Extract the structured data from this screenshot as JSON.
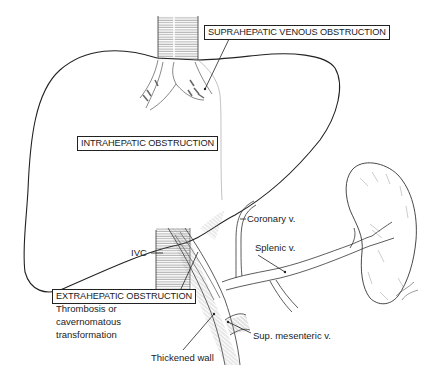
{
  "figure": {
    "labels": {
      "suprahepatic": "SUPRAHEPATIC VENOUS OBSTRUCTION",
      "intrahepatic": "INTRAHEPATIC OBSTRUCTION",
      "extrahepatic": "EXTRAHEPATIC OBSTRUCTION",
      "extrahepatic_detail": [
        "Thrombosis or",
        "cavernomatous",
        "transformation"
      ],
      "ivc": "IVC",
      "coronary": "Coronary v.",
      "splenic": "Splenic v.",
      "sup_mesenteric": "Sup. mesenteric v.",
      "thickened_wall": "Thickened wall"
    },
    "structures": [
      "liver",
      "inferior-vena-cava",
      "hepatic-veins",
      "portal-vein",
      "coronary-vein",
      "splenic-vein",
      "superior-mesenteric-vein",
      "spleen"
    ],
    "colors": {
      "ink": "#222222",
      "hatch": "#777777",
      "background": "#ffffff"
    }
  }
}
